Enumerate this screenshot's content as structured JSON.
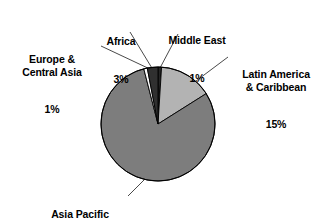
{
  "chart_data": {
    "type": "pie",
    "title": "",
    "legend_position": "none",
    "labels_outside": true,
    "categories": [
      "Middle East",
      "Latin America & Caribbean",
      "Asia Pacific",
      "Europe & Central Asia",
      "Africa"
    ],
    "values": [
      1,
      15,
      79.7,
      1,
      3
    ],
    "value_labels": [
      "1%",
      "15%",
      "79.7%",
      "1%",
      "3%"
    ],
    "colors": [
      "#262626",
      "#b3b3b3",
      "#7d7d7d",
      "#fbfbfb",
      "#303030"
    ],
    "slices": [
      {
        "name": "Middle East",
        "value": 1,
        "value_label": "1%",
        "color": "#262626"
      },
      {
        "name": "Latin America & Caribbean",
        "value": 15,
        "value_label": "15%",
        "color": "#b3b3b3"
      },
      {
        "name": "Asia Pacific",
        "value": 79.7,
        "value_label": "79.7%",
        "color": "#7d7d7d"
      },
      {
        "name": "Europe & Central Asia",
        "value": 1,
        "value_label": "1%",
        "color": "#fbfbfb"
      },
      {
        "name": "Africa",
        "value": 3,
        "value_label": "3%",
        "color": "#303030"
      }
    ],
    "outline_color": "#000000"
  },
  "labels": {
    "europe": {
      "name": "Europe &\nCentral Asia",
      "value": "1%"
    },
    "africa": {
      "name": "Africa",
      "value": "3%"
    },
    "middle_east": {
      "name": "Middle East",
      "value": "1%"
    },
    "latin": {
      "name": "Latin America\n& Caribbean",
      "value": "15%"
    },
    "asia": {
      "name": "Asia Pacific",
      "value": "79.7%"
    }
  }
}
